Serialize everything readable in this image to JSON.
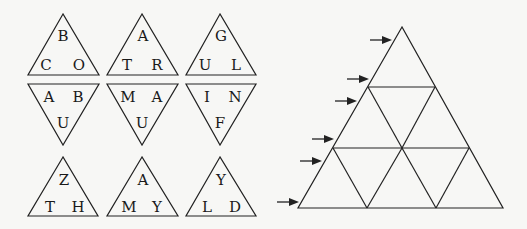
{
  "pieces": [
    {
      "id": "r1c1",
      "dir": "up",
      "letters": {
        "top": "B",
        "left": "C",
        "right": "O"
      }
    },
    {
      "id": "r1c2",
      "dir": "up",
      "letters": {
        "top": "A",
        "left": "T",
        "right": "R"
      }
    },
    {
      "id": "r1c3",
      "dir": "up",
      "letters": {
        "top": "G",
        "left": "U",
        "right": "L"
      }
    },
    {
      "id": "r2c1",
      "dir": "down",
      "letters": {
        "left": "A",
        "right": "B",
        "bottom": "U"
      }
    },
    {
      "id": "r2c2",
      "dir": "down",
      "letters": {
        "left": "M",
        "right": "A",
        "bottom": "U"
      }
    },
    {
      "id": "r2c3",
      "dir": "down",
      "letters": {
        "left": "I",
        "right": "N",
        "bottom": "F"
      }
    },
    {
      "id": "r3c1",
      "dir": "up",
      "letters": {
        "top": "Z",
        "left": "T",
        "right": "H"
      }
    },
    {
      "id": "r3c2",
      "dir": "up",
      "letters": {
        "top": "A",
        "left": "M",
        "right": "Y"
      }
    },
    {
      "id": "r3c3",
      "dir": "up",
      "letters": {
        "top": "Y",
        "left": "L",
        "right": "D"
      }
    }
  ],
  "target_grid": {
    "rows": 3,
    "small_triangles": 9,
    "arrow_count": 6
  }
}
